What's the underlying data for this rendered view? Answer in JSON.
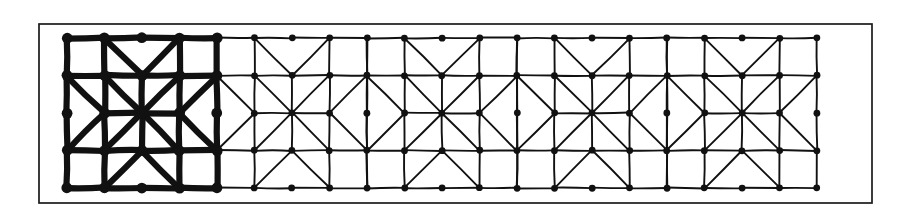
{
  "figure": {
    "background_color": "#ffffff",
    "ink_color": "#111111"
  },
  "frame": {
    "name": "outer-rectangle-border",
    "x": 39,
    "y": 24,
    "width": 833,
    "height": 179,
    "stroke_width": 1.7,
    "color": "#1a1a1a"
  },
  "pattern": {
    "origin_x": 67,
    "origin_y": 38,
    "cell_size": 150,
    "cell_count": 5,
    "rows": 1,
    "subdivisions": 4,
    "step": 37.5,
    "bold_cells": [
      0
    ],
    "thin_stroke_width": 1.9,
    "bold_stroke_width": 6.2,
    "node_radius_thin": 3.4,
    "node_radius_bold": 5.4,
    "node_color": "#111111",
    "star_points": 8,
    "pattern_left": 67,
    "pattern_right": 817,
    "pattern_top": 38,
    "pattern_bottom": 188
  },
  "cells": [
    {
      "index": 0,
      "center_x": 142,
      "center_y": 113,
      "weight": "bold"
    },
    {
      "index": 1,
      "center_x": 292,
      "center_y": 113,
      "weight": "thin"
    },
    {
      "index": 2,
      "center_x": 442,
      "center_y": 113,
      "weight": "thin"
    },
    {
      "index": 3,
      "center_x": 592,
      "center_y": 113,
      "weight": "thin"
    },
    {
      "index": 4,
      "center_x": 742,
      "center_y": 113,
      "weight": "thin"
    }
  ],
  "chart_data": {
    "type": "diagram",
    "subtype": "geometric-tiling",
    "lattice": {
      "cell_size": 150,
      "columns": 5,
      "rows": 1,
      "sub_grid": 4,
      "node_spacing": 37.5
    },
    "motif": {
      "name": "eight-pointed-star-rosette",
      "rays": 8,
      "ray_angles_deg": [
        0,
        45,
        90,
        135,
        180,
        225,
        270,
        315
      ],
      "surrounding_shapes": [
        "corner-square",
        "chevron",
        "kite",
        "triangle"
      ]
    },
    "emphasis": {
      "bold_cell_indices": [
        0
      ],
      "bold_stroke_width": 6.2,
      "thin_stroke_width": 1.9
    },
    "node_count_per_cell": 21,
    "legend": [],
    "annotations": []
  }
}
